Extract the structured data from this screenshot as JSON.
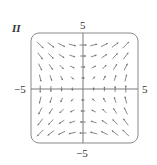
{
  "figure": {
    "corner_label": "II",
    "tick_labels": {
      "top": "5",
      "bottom": "−5",
      "left": "−5",
      "right": "5"
    },
    "colors": {
      "frame": "#8a8a8a",
      "axes": "#7a7a7a",
      "arrows": "#6a6a6a",
      "text": "#333333"
    }
  },
  "chart_data": {
    "type": "vector_field",
    "title": "",
    "panel_label": "II",
    "field": "F(x, y) = (y, x)",
    "xlim": [
      -5,
      5
    ],
    "ylim": [
      -5,
      5
    ],
    "xticks": [
      -5,
      5
    ],
    "yticks": [
      -5,
      5
    ],
    "grid": false,
    "axes_through_origin": true,
    "sample_grid": {
      "x": [
        -4,
        -3,
        -2,
        -1,
        0,
        1,
        2,
        3,
        4
      ],
      "y": [
        -4,
        -3,
        -2,
        -1,
        0,
        1,
        2,
        3,
        4
      ]
    }
  }
}
